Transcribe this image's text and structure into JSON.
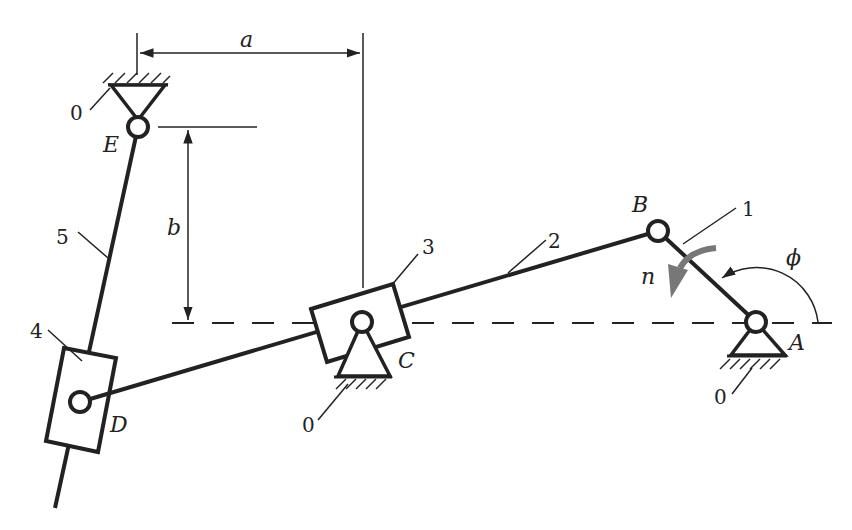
{
  "diagram": {
    "type": "mechanism-kinematic-diagram",
    "joints": {
      "A": "A",
      "B": "B",
      "C": "C",
      "D": "D",
      "E": "E"
    },
    "links": {
      "link1": "1",
      "link2": "2",
      "link3": "3",
      "link4": "4",
      "link5": "5"
    },
    "ground_labels": {
      "ground_E": "0",
      "ground_C": "0",
      "ground_A": "0"
    },
    "dimensions": {
      "horizontal": "a",
      "vertical": "b"
    },
    "annotations": {
      "angle": "ϕ",
      "rotation_speed": "n"
    },
    "colors": {
      "stroke": "#222222",
      "rotation_arrow": "#777777",
      "background": "#ffffff"
    }
  }
}
